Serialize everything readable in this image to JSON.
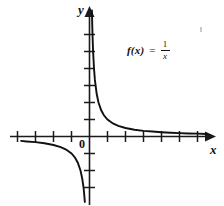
{
  "figure": {
    "background_color": "#ffffff",
    "line_color": "#111111",
    "width": 224,
    "height": 206
  },
  "labels": {
    "y_axis": "y",
    "x_axis": "x",
    "origin": "0"
  },
  "equation": {
    "lhs": "f(x)",
    "equals": "=",
    "numerator": "1",
    "denominator": "x",
    "plain": "f(x) = 1/x"
  },
  "chart_data": {
    "type": "line",
    "title": "",
    "subtitle": "",
    "xlabel": "x",
    "ylabel": "y",
    "annotations": [
      "f(x) = 1/x"
    ],
    "legend_position": "none",
    "grid": false,
    "function": "y = 1/x",
    "xlim": [
      -4.5,
      6.8
    ],
    "ylim": [
      -4.2,
      7.4
    ],
    "x_ticks": [
      -4,
      -3,
      -2,
      -1,
      1,
      2,
      3,
      4,
      5,
      6
    ],
    "y_ticks": [
      -3,
      -2,
      -1,
      1,
      2,
      3,
      4,
      5
    ],
    "series": [
      {
        "name": "branch-quadrant-I",
        "x": [
          0.135,
          0.15,
          0.17,
          0.2,
          0.25,
          0.3,
          0.4,
          0.5,
          0.65,
          0.8,
          1.0,
          1.3,
          1.6,
          2.0,
          2.5,
          3.0,
          3.5,
          4.0,
          4.5,
          5.0,
          5.5,
          6.0,
          6.5
        ],
        "y": [
          7.41,
          6.67,
          5.88,
          5.0,
          4.0,
          3.33,
          2.5,
          2.0,
          1.54,
          1.25,
          1.0,
          0.77,
          0.63,
          0.5,
          0.4,
          0.33,
          0.29,
          0.25,
          0.22,
          0.2,
          0.18,
          0.17,
          0.15
        ]
      },
      {
        "name": "branch-quadrant-III",
        "x": [
          -3.8,
          -3.5,
          -3.0,
          -2.5,
          -2.0,
          -1.6,
          -1.3,
          -1.0,
          -0.8,
          -0.65,
          -0.5,
          -0.4,
          -0.33,
          -0.29,
          -0.26
        ],
        "y": [
          -0.26,
          -0.29,
          -0.33,
          -0.4,
          -0.5,
          -0.63,
          -0.77,
          -1.0,
          -1.25,
          -1.54,
          -2.0,
          -2.5,
          -3.0,
          -3.45,
          -3.85
        ]
      }
    ]
  }
}
